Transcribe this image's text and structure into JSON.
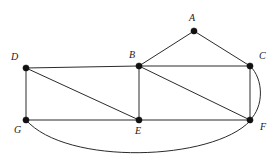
{
  "figure": {
    "canvas": {
      "width": 277,
      "height": 165
    },
    "background_color": "#ffffff",
    "edge_color": "#2b2b2b",
    "vertex_color": "#111111",
    "label_color": "#1a1a1a"
  },
  "vertices": [
    {
      "id": "A",
      "label": "A",
      "x": 194,
      "y": 31,
      "label_x": 189,
      "label_y": 13,
      "r": 3.1
    },
    {
      "id": "B",
      "label": "B",
      "x": 139,
      "y": 66,
      "label_x": 129,
      "label_y": 50,
      "r": 3.1
    },
    {
      "id": "C",
      "label": "C",
      "x": 250,
      "y": 66,
      "label_x": 259,
      "label_y": 51,
      "r": 3.1
    },
    {
      "id": "D",
      "label": "D",
      "x": 26,
      "y": 68,
      "label_x": 11,
      "label_y": 52,
      "r": 3.1
    },
    {
      "id": "E",
      "label": "E",
      "x": 139,
      "y": 120,
      "label_x": 135,
      "label_y": 126,
      "r": 3.1
    },
    {
      "id": "F",
      "label": "F",
      "x": 250,
      "y": 120,
      "label_x": 260,
      "label_y": 122,
      "r": 3.1
    },
    {
      "id": "G",
      "label": "G",
      "x": 26,
      "y": 120,
      "label_x": 14,
      "label_y": 125,
      "r": 3.1
    }
  ],
  "edges": [
    {
      "id": "A-B",
      "from": "A",
      "to": "B",
      "kind": "straight",
      "path": "M 194 31 L 139 66"
    },
    {
      "id": "A-C",
      "from": "A",
      "to": "C",
      "kind": "straight",
      "path": "M 194 31 L 250 66"
    },
    {
      "id": "D-B",
      "from": "D",
      "to": "B",
      "kind": "straight",
      "path": "M 26 68 L 139 66"
    },
    {
      "id": "B-C",
      "from": "B",
      "to": "C",
      "kind": "straight",
      "path": "M 139 66 L 250 66"
    },
    {
      "id": "D-G",
      "from": "D",
      "to": "G",
      "kind": "straight",
      "path": "M 26 68 L 26 120"
    },
    {
      "id": "D-E",
      "from": "D",
      "to": "E",
      "kind": "straight",
      "path": "M 26 68 L 139 120"
    },
    {
      "id": "B-E",
      "from": "B",
      "to": "E",
      "kind": "straight",
      "path": "M 139 66 L 139 120"
    },
    {
      "id": "B-F",
      "from": "B",
      "to": "F",
      "kind": "straight",
      "path": "M 139 66 L 250 120"
    },
    {
      "id": "C-F",
      "from": "C",
      "to": "F",
      "kind": "straight",
      "path": "M 250 66 L 250 120"
    },
    {
      "id": "C-F-curve",
      "from": "C",
      "to": "F",
      "kind": "curved",
      "path": "M 250 66 C 264 79 264 107 250 120"
    },
    {
      "id": "G-E",
      "from": "G",
      "to": "E",
      "kind": "straight",
      "path": "M 26 120 L 139 120"
    },
    {
      "id": "E-F",
      "from": "E",
      "to": "F",
      "kind": "straight",
      "path": "M 139 120 L 250 120"
    },
    {
      "id": "G-F-curve",
      "from": "G",
      "to": "F",
      "kind": "curved",
      "path": "M 26 120 C 66 166 213 161 250 121"
    }
  ]
}
